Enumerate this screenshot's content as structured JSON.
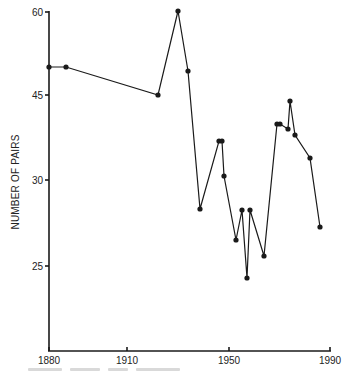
{
  "chart_data": {
    "type": "line",
    "title": "",
    "xlabel": "",
    "ylabel": "NUMBER OF PAIRS",
    "x_ticks": [
      1880,
      1910,
      1950,
      1990
    ],
    "y_ticks": [
      60,
      45,
      30,
      25
    ],
    "xlim": [
      1880,
      1990
    ],
    "grid": false,
    "legend": null,
    "series": [
      {
        "name": "Number of pairs",
        "x": [
          1880,
          1887,
          1923,
          1930,
          1934,
          1939,
          1946,
          1947,
          1948,
          1953,
          1955,
          1957,
          1959,
          1964,
          1969,
          1970,
          1973,
          1974,
          1976,
          1982,
          1986
        ],
        "values": [
          50,
          50,
          45,
          60,
          49,
          28,
          37,
          37,
          31,
          26.5,
          28,
          24,
          28,
          26,
          39,
          39,
          38.5,
          44,
          37.5,
          34,
          27
        ]
      }
    ],
    "pixel_points": [
      [
        49,
        67
      ],
      [
        66,
        67
      ],
      [
        158,
        95
      ],
      [
        178,
        11
      ],
      [
        188,
        71
      ],
      [
        200,
        209
      ],
      [
        219,
        141
      ],
      [
        222,
        141
      ],
      [
        224,
        176
      ],
      [
        236,
        240
      ],
      [
        242,
        210
      ],
      [
        247,
        278
      ],
      [
        250,
        210
      ],
      [
        264,
        256
      ],
      [
        277,
        124
      ],
      [
        280,
        124
      ],
      [
        288,
        129
      ],
      [
        290,
        101
      ],
      [
        295,
        135
      ],
      [
        310,
        158
      ],
      [
        320,
        227
      ]
    ],
    "y_tick_pixels": [
      12,
      95,
      180,
      266
    ],
    "x_tick_pixels": [
      49,
      127,
      229,
      330
    ]
  },
  "colors": {
    "line": "#1a1a1a",
    "background": "#ffffff"
  }
}
